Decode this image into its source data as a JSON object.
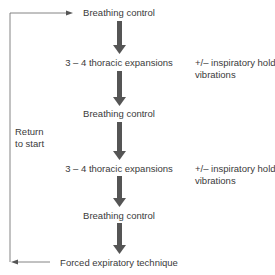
{
  "diagram": {
    "steps": [
      {
        "label": "Breathing control"
      },
      {
        "label": "3 – 4 thoracic expansions",
        "note_line1": "+/– inspiratory hold",
        "note_line2": "vibrations"
      },
      {
        "label": "Breathing control"
      },
      {
        "label": "3 – 4 thoracic expansions",
        "note_line1": "+/– inspiratory hold",
        "note_line2": "vibrations"
      },
      {
        "label": "Breathing control"
      },
      {
        "label": "Forced expiratory technique"
      }
    ],
    "loop_label_line1": "Return",
    "loop_label_line2": "to start",
    "colors": {
      "arrow": "#555555",
      "line": "#777777",
      "text": "#3a3a3a"
    }
  }
}
